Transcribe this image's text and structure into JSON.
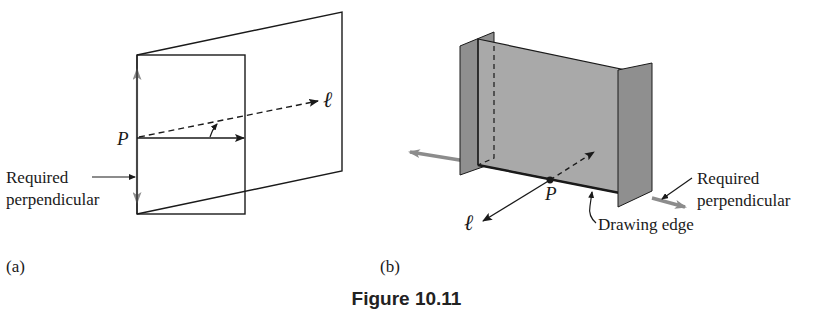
{
  "figure": {
    "caption": "Figure 10.11",
    "panels": [
      {
        "id": "a",
        "label": "(a)",
        "point_label": "P",
        "line_label": "ℓ",
        "annotation_line1": "Required",
        "annotation_line2": "perpendicular"
      },
      {
        "id": "b",
        "label": "(b)",
        "point_label": "P",
        "line_label": "ℓ",
        "annotation_line1": "Required",
        "annotation_line2": "perpendicular",
        "edge_label": "Drawing edge"
      }
    ],
    "colors": {
      "ink": "#1a1a1a",
      "perpendicular_gray": "#8c8c8c",
      "plane_fill": "#a9a9a9",
      "fold_fill": "#8f8f8f",
      "background": "#ffffff"
    }
  }
}
